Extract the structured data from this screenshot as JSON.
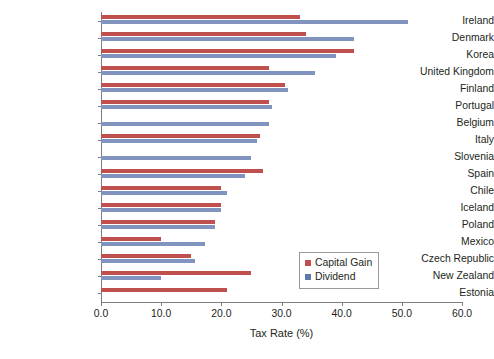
{
  "chart_data": {
    "type": "bar",
    "orientation": "horizontal",
    "title": "",
    "subtitle": "",
    "xlabel": "Tax Rate (%)",
    "ylabel": "",
    "xlim": [
      0.0,
      60.0
    ],
    "xticks": [
      "0.0",
      "10.0",
      "20.0",
      "30.0",
      "40.0",
      "50.0",
      "60.0"
    ],
    "xtick_values": [
      0,
      10,
      20,
      30,
      40,
      50,
      60
    ],
    "grid": false,
    "legend_position": "inside-right-lower",
    "categories": [
      "Ireland",
      "Denmark",
      "Korea",
      "United Kingdom",
      "Finland",
      "Portugal",
      "Belgium",
      "Italy",
      "Slovenia",
      "Spain",
      "Chile",
      "Iceland",
      "Poland",
      "Mexico",
      "Czech Republic",
      "New Zealand",
      "Estonia"
    ],
    "series": [
      {
        "name": "Capital Gain",
        "color": "#c0504d",
        "values": [
          33.0,
          34.0,
          42.0,
          28.0,
          30.6,
          28.0,
          0.0,
          26.5,
          0.0,
          27.0,
          20.0,
          20.0,
          19.0,
          10.0,
          15.0,
          25.0,
          21.0
        ]
      },
      {
        "name": "Dividend",
        "color": "#8094bf",
        "values": [
          51.0,
          42.0,
          39.0,
          35.5,
          31.0,
          28.5,
          28.0,
          26.0,
          25.0,
          24.0,
          21.0,
          20.0,
          19.0,
          17.3,
          15.6,
          10.0,
          0.0
        ]
      }
    ]
  },
  "legend": {
    "items": [
      {
        "label": "Capital Gain",
        "color": "#c0504d"
      },
      {
        "label": "Dividend",
        "color": "#5f7aa8"
      }
    ]
  }
}
